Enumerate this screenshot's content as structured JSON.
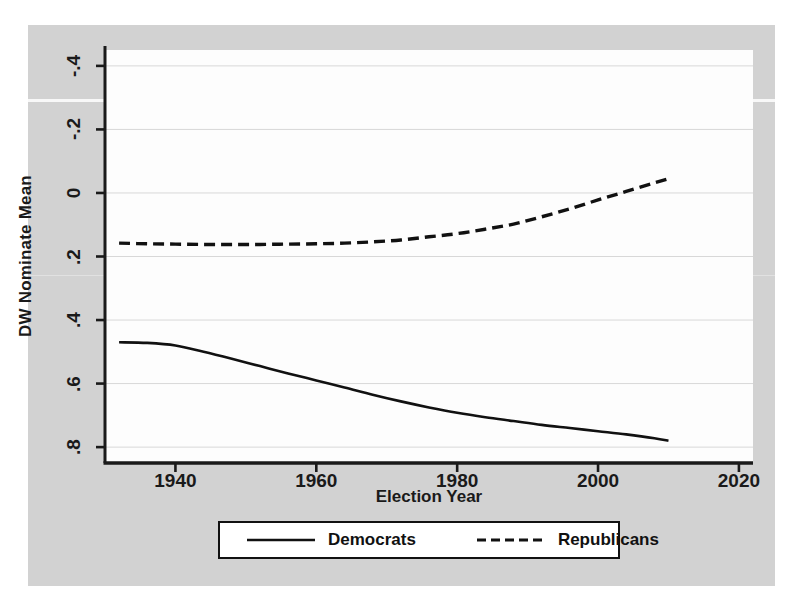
{
  "figure": {
    "background_color": "#d2d2d2",
    "plot_background_color": "#fdfdfd"
  },
  "axes": {
    "ylabel": "DW Nominate Mean",
    "xlabel": "Election Year",
    "yticks": [
      ".8",
      ".6",
      ".4",
      ".2",
      "0",
      "-.2",
      "-.4"
    ],
    "xticks": [
      "1940",
      "1960",
      "1980",
      "2000",
      "2020"
    ]
  },
  "legend": {
    "entries": [
      {
        "label": "Democrats",
        "style": "solid"
      },
      {
        "label": "Republicans",
        "style": "dashed"
      }
    ]
  },
  "chart_data": {
    "type": "line",
    "title": "",
    "xlabel": "Election Year",
    "ylabel": "DW Nominate Mean",
    "xlim": [
      1930,
      2022
    ],
    "ylim": [
      -0.45,
      0.85
    ],
    "xticks": [
      1940,
      1960,
      1980,
      2000,
      2020
    ],
    "yticks": [
      -0.4,
      -0.2,
      0,
      0.2,
      0.4,
      0.6,
      0.8
    ],
    "grid": "horizontal",
    "legend_position": "below-axes",
    "x": [
      1932,
      1936,
      1940,
      1944,
      1948,
      1952,
      1956,
      1960,
      1964,
      1968,
      1972,
      1976,
      1980,
      1984,
      1988,
      1992,
      1996,
      2000,
      2004,
      2008,
      2010
    ],
    "series": [
      {
        "name": "Democrats",
        "style": "solid",
        "color": "#111111",
        "values": [
          -0.07,
          -0.072,
          -0.08,
          -0.1,
          -0.122,
          -0.145,
          -0.168,
          -0.19,
          -0.212,
          -0.235,
          -0.256,
          -0.275,
          -0.292,
          -0.306,
          -0.318,
          -0.33,
          -0.34,
          -0.35,
          -0.36,
          -0.372,
          -0.38
        ]
      },
      {
        "name": "Republicans",
        "style": "dashed",
        "color": "#111111",
        "values": [
          0.242,
          0.24,
          0.239,
          0.238,
          0.238,
          0.238,
          0.239,
          0.24,
          0.242,
          0.246,
          0.252,
          0.262,
          0.272,
          0.286,
          0.302,
          0.325,
          0.35,
          0.378,
          0.405,
          0.432,
          0.445
        ]
      }
    ]
  }
}
